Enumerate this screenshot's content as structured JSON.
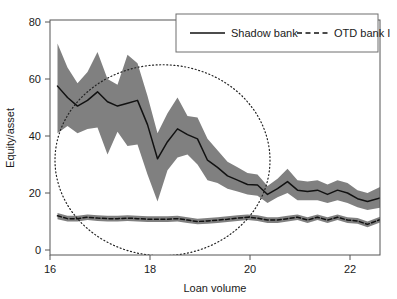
{
  "chart_data": {
    "type": "line",
    "title": "",
    "xlabel": "Loan volume",
    "ylabel": "Equity/asset",
    "xlim": [
      15.8,
      22.8
    ],
    "ylim": [
      -3,
      84
    ],
    "xticks": [
      16,
      18,
      20,
      22
    ],
    "yticks": [
      0,
      20,
      40,
      60,
      80
    ],
    "grid": false,
    "legend_position": "top-right",
    "band_color": "#808080",
    "line_color": "#111111",
    "axis_color": "#555555",
    "x": [
      16.15,
      16.35,
      16.55,
      16.75,
      16.95,
      17.15,
      17.35,
      17.55,
      17.75,
      17.95,
      18.15,
      18.35,
      18.55,
      18.75,
      18.95,
      19.15,
      19.35,
      19.55,
      19.75,
      19.95,
      20.15,
      20.35,
      20.55,
      20.75,
      20.95,
      21.15,
      21.35,
      21.55,
      21.75,
      21.95,
      22.15,
      22.35,
      22.65
    ],
    "series": [
      {
        "name": "Shadow bank",
        "style": "solid",
        "values": [
          57.5,
          53.5,
          50.5,
          52.5,
          55.5,
          52.0,
          50.5,
          51.5,
          52.5,
          44.0,
          32.0,
          38.0,
          42.5,
          40.5,
          39.0,
          31.5,
          29.0,
          26.0,
          24.5,
          23.0,
          22.8,
          19.5,
          21.5,
          24.0,
          21.0,
          20.5,
          21.0,
          19.5,
          21.0,
          20.0,
          18.0,
          17.0,
          18.5
        ],
        "band_upper": [
          72.5,
          64.0,
          58.5,
          62.5,
          69.5,
          60.0,
          58.0,
          68.5,
          65.5,
          54.0,
          41.0,
          48.0,
          53.5,
          47.0,
          46.5,
          39.0,
          35.0,
          31.0,
          29.0,
          27.0,
          26.5,
          22.5,
          25.0,
          28.5,
          24.5,
          24.0,
          24.5,
          23.0,
          24.5,
          23.5,
          21.0,
          20.0,
          22.5
        ],
        "band_lower": [
          41.0,
          43.5,
          41.0,
          42.5,
          43.0,
          33.5,
          41.5,
          36.5,
          37.0,
          26.5,
          17.0,
          28.0,
          32.5,
          33.5,
          30.0,
          24.5,
          23.5,
          21.5,
          20.5,
          19.5,
          19.0,
          16.5,
          18.5,
          20.0,
          17.5,
          17.5,
          17.5,
          16.5,
          17.5,
          16.5,
          15.0,
          14.0,
          15.0
        ]
      },
      {
        "name": "OTD bank I",
        "style": "dashed",
        "values": [
          12.0,
          11.0,
          11.0,
          11.5,
          11.2,
          11.0,
          11.0,
          11.2,
          11.0,
          10.8,
          10.8,
          10.8,
          11.0,
          10.5,
          10.0,
          10.2,
          10.5,
          10.8,
          11.2,
          11.5,
          11.2,
          10.5,
          10.5,
          11.0,
          11.5,
          10.5,
          11.5,
          10.5,
          11.5,
          10.5,
          10.2,
          9.0,
          11.0
        ],
        "band_upper": [
          13.0,
          12.0,
          12.0,
          12.5,
          12.2,
          12.0,
          12.0,
          12.2,
          12.0,
          11.8,
          11.8,
          11.8,
          12.0,
          11.5,
          11.0,
          11.2,
          11.5,
          11.8,
          12.2,
          12.5,
          12.2,
          11.5,
          11.5,
          12.0,
          12.5,
          11.5,
          12.5,
          11.5,
          12.5,
          11.5,
          11.2,
          10.0,
          12.0
        ],
        "band_lower": [
          10.8,
          10.0,
          10.0,
          10.5,
          10.2,
          10.0,
          10.0,
          10.2,
          10.0,
          9.8,
          9.8,
          9.8,
          10.0,
          9.5,
          9.0,
          9.2,
          9.5,
          9.8,
          10.2,
          10.5,
          10.2,
          9.5,
          9.5,
          10.0,
          10.5,
          9.5,
          10.5,
          9.5,
          10.5,
          9.5,
          9.2,
          8.0,
          10.0
        ]
      }
    ],
    "annotations": [
      {
        "kind": "ellipse",
        "style": "dotted",
        "cx": 18.25,
        "cy": 31.5,
        "rx": 2.15,
        "ry": 33.5
      }
    ]
  },
  "legend": {
    "entries": [
      {
        "label": "Shadow bank",
        "style": "solid"
      },
      {
        "label": "OTD bank I",
        "style": "dashed"
      }
    ]
  },
  "axes": {
    "x_title": "Loan volume",
    "y_title": "Equity/asset",
    "x_tick_labels": [
      "16",
      "18",
      "20",
      "22"
    ],
    "y_tick_labels": [
      "0",
      "20",
      "40",
      "60",
      "80"
    ]
  }
}
